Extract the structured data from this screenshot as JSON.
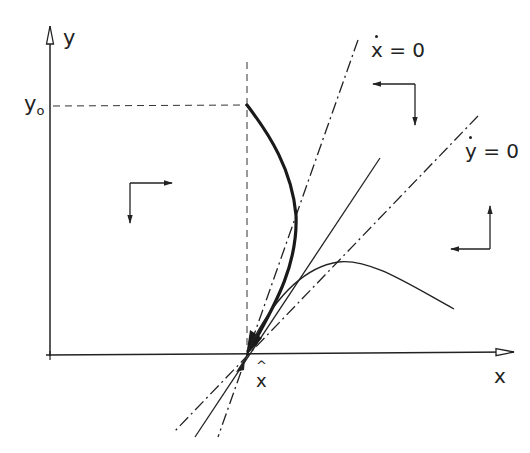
{
  "diagram": {
    "type": "phase-plane",
    "colors": {
      "ink": "#222222",
      "background": "#ffffff"
    },
    "axes": {
      "x_label": "x",
      "y_label": "y",
      "y0_label": "y",
      "y0_subscript": "o",
      "xhat_label": "x",
      "xhat_accent": "^"
    },
    "nullclines": [
      {
        "id": "xdot-zero",
        "label_var": "x",
        "label_eq": "= 0",
        "style": "dash-dot"
      },
      {
        "id": "ydot-zero",
        "label_var": "y",
        "label_eq": "= 0",
        "style": "dash-dot"
      }
    ],
    "trajectories": [
      {
        "id": "thick-trajectory",
        "from": "(x̂, y0)",
        "to": "x̂",
        "style": "thick-solid"
      },
      {
        "id": "thin-trajectory",
        "style": "thin-solid"
      },
      {
        "id": "straight-separatrix",
        "style": "thin-solid"
      }
    ],
    "direction_indicators": [
      {
        "region": "left",
        "horizontal": "right",
        "vertical": "down"
      },
      {
        "region": "upper-right",
        "horizontal": "left",
        "vertical": "down"
      },
      {
        "region": "lower-right",
        "horizontal": "left",
        "vertical": "up"
      }
    ]
  }
}
